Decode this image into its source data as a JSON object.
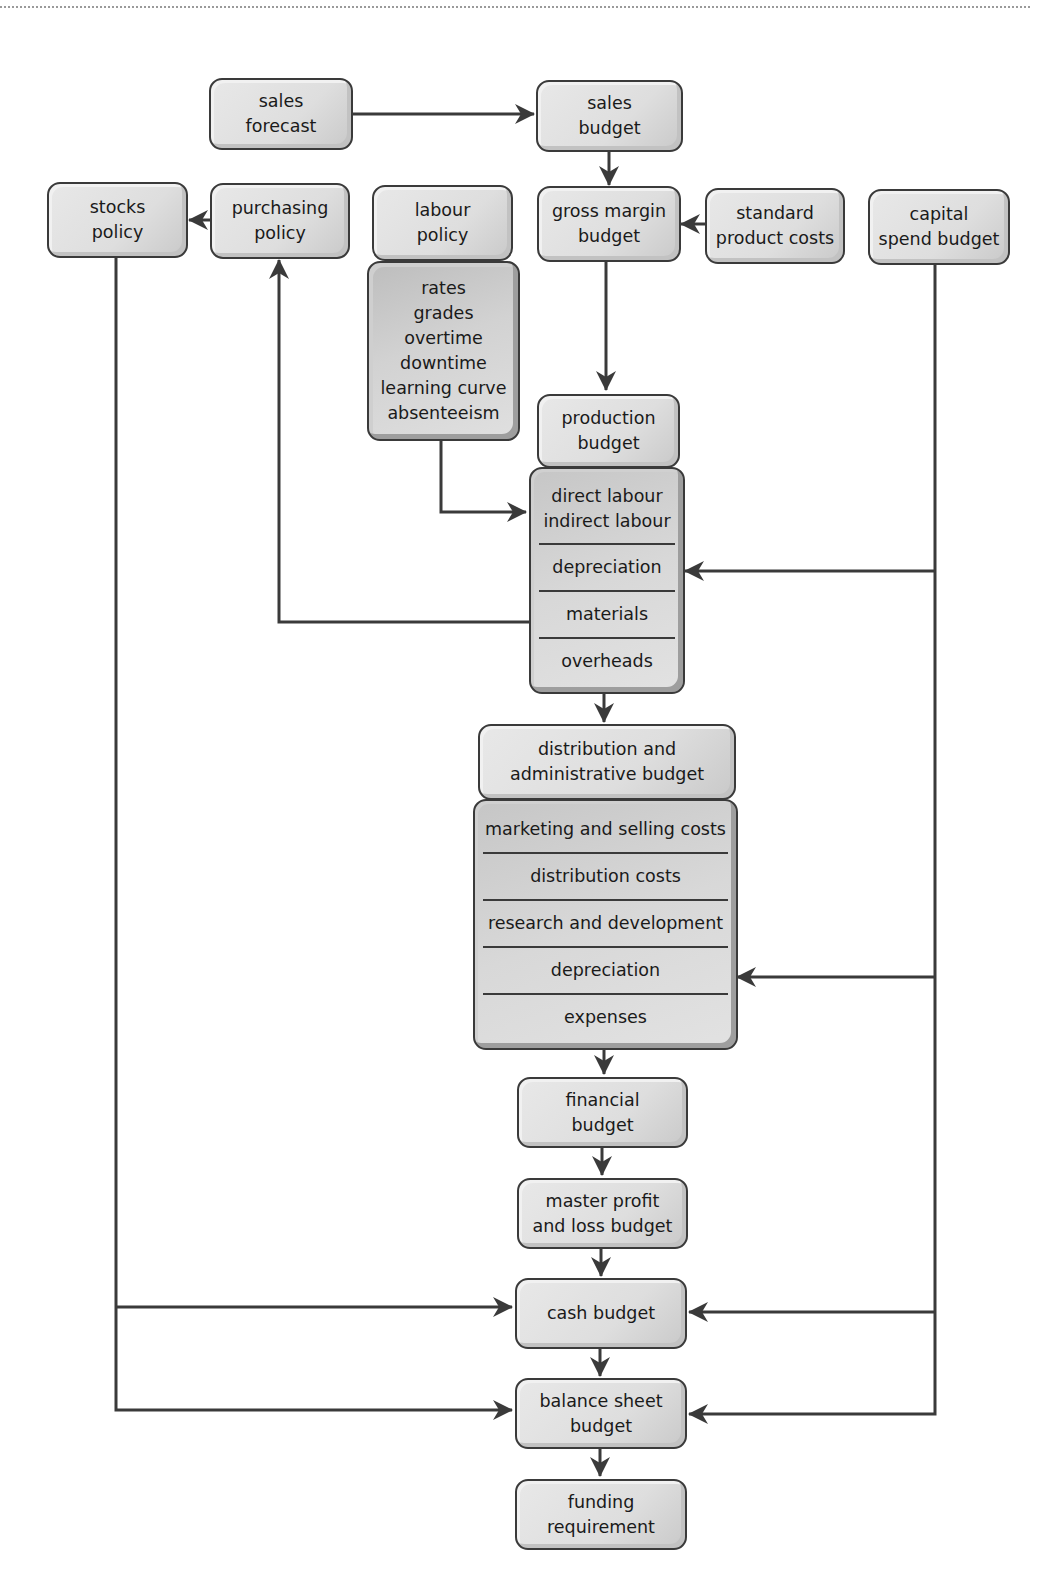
{
  "diagram": {
    "type": "budget flow chart",
    "nodes": {
      "sales_forecast": {
        "lines": [
          "sales",
          "forecast"
        ]
      },
      "sales_budget": {
        "lines": [
          "sales",
          "budget"
        ]
      },
      "stocks_policy": {
        "lines": [
          "stocks",
          "policy"
        ]
      },
      "purchasing_policy": {
        "lines": [
          "purchasing",
          "policy"
        ]
      },
      "labour_policy": {
        "lines": [
          "labour",
          "policy"
        ]
      },
      "labour_details": {
        "lines": [
          "rates",
          "grades",
          "overtime",
          "downtime",
          "learning curve",
          "absenteeism"
        ]
      },
      "gross_margin_budget": {
        "lines": [
          "gross margin",
          "budget"
        ]
      },
      "standard_product_costs": {
        "lines": [
          "standard",
          "product costs"
        ]
      },
      "capital_spend_budget": {
        "lines": [
          "capital",
          "spend budget"
        ]
      },
      "production_budget": {
        "lines": [
          "production",
          "budget"
        ]
      },
      "production_items": [
        {
          "lines": [
            "direct labour",
            "indirect labour"
          ]
        },
        {
          "lines": [
            "depreciation"
          ]
        },
        {
          "lines": [
            "materials"
          ]
        },
        {
          "lines": [
            "overheads"
          ]
        }
      ],
      "distribution_admin_budget": {
        "lines": [
          "distribution and",
          "administrative budget"
        ]
      },
      "distribution_items": [
        {
          "lines": [
            "marketing and selling costs"
          ]
        },
        {
          "lines": [
            "distribution costs"
          ]
        },
        {
          "lines": [
            "research and development"
          ]
        },
        {
          "lines": [
            "depreciation"
          ]
        },
        {
          "lines": [
            "expenses"
          ]
        }
      ],
      "financial_budget": {
        "lines": [
          "financial",
          "budget"
        ]
      },
      "master_pl_budget": {
        "lines": [
          "master profit",
          "and loss budget"
        ]
      },
      "cash_budget": {
        "lines": [
          "cash budget"
        ]
      },
      "balance_sheet_budget": {
        "lines": [
          "balance sheet",
          "budget"
        ]
      },
      "funding_requirement": {
        "lines": [
          "funding",
          "requirement"
        ]
      }
    },
    "edges": [
      {
        "from": "sales forecast",
        "to": "sales budget"
      },
      {
        "from": "sales budget",
        "to": "gross margin budget"
      },
      {
        "from": "standard product costs",
        "to": "gross margin budget"
      },
      {
        "from": "purchasing policy",
        "to": "stocks policy"
      },
      {
        "from": "gross margin budget",
        "to": "production budget"
      },
      {
        "from": "labour policy details",
        "to": "direct/indirect labour"
      },
      {
        "from": "capital spend budget",
        "to": "production depreciation"
      },
      {
        "from": "materials",
        "to": "purchasing policy"
      },
      {
        "from": "production budget",
        "to": "distribution and administrative budget"
      },
      {
        "from": "capital spend budget",
        "to": "distribution depreciation"
      },
      {
        "from": "distribution and administrative budget",
        "to": "financial budget"
      },
      {
        "from": "financial budget",
        "to": "master profit and loss budget"
      },
      {
        "from": "master profit and loss budget",
        "to": "cash budget"
      },
      {
        "from": "stocks policy",
        "to": "cash budget"
      },
      {
        "from": "capital spend budget",
        "to": "cash budget"
      },
      {
        "from": "cash budget",
        "to": "balance sheet budget"
      },
      {
        "from": "stocks policy",
        "to": "balance sheet budget"
      },
      {
        "from": "capital spend budget",
        "to": "balance sheet budget"
      },
      {
        "from": "balance sheet budget",
        "to": "funding requirement"
      }
    ],
    "colors": {
      "line": "#3a3a3a",
      "box_fill": "#e0e0e0",
      "box_fill_dark": "#c8c8c8",
      "border": "#3a3a3a"
    }
  }
}
